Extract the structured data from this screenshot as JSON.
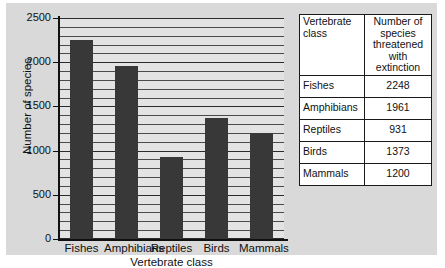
{
  "chart_data": {
    "type": "bar",
    "title": "",
    "xlabel": "Vertebrate class",
    "ylabel": "Number of species",
    "categories": [
      "Fishes",
      "Amphibians",
      "Reptiles",
      "Birds",
      "Mammals"
    ],
    "values": [
      2248,
      1961,
      931,
      1373,
      1200
    ],
    "ylim": [
      0,
      2500
    ],
    "yticks": [
      0,
      500,
      1000,
      1500,
      2000,
      2500
    ],
    "ytick_labels": [
      "0",
      "500",
      "1000",
      "1500",
      "2000",
      "2500"
    ],
    "grid": true,
    "grid_interval": 100,
    "legend": "none",
    "bar_color": "#383838",
    "plot_background": "#e3e3e3",
    "figure_background": "#d9d9d9"
  },
  "table": {
    "header": {
      "col1": "Vertebrate class",
      "col2": "Number of species threatened with extinction"
    },
    "rows": [
      {
        "cls": "Fishes",
        "num": "2248"
      },
      {
        "cls": "Amphibians",
        "num": "1961"
      },
      {
        "cls": "Reptiles",
        "num": "931"
      },
      {
        "cls": "Birds",
        "num": "1373"
      },
      {
        "cls": "Mammals",
        "num": "1200"
      }
    ]
  }
}
